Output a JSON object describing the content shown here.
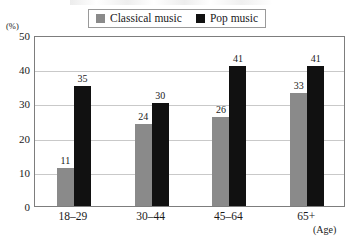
{
  "chart_data": {
    "type": "bar",
    "title": "",
    "xlabel": "(Age)",
    "ylabel": "(%)",
    "categories": [
      "18–29",
      "30–44",
      "45–64",
      "65+"
    ],
    "series": [
      {
        "name": "Classical music",
        "color": "#8a8a8a",
        "values": [
          11,
          24,
          26,
          33
        ]
      },
      {
        "name": "Pop music",
        "color": "#111111",
        "values": [
          35,
          30,
          41,
          41
        ]
      }
    ],
    "ylim": [
      0,
      50
    ],
    "ytick_labels": [
      "50",
      "40",
      "30",
      "20",
      "10",
      "0"
    ],
    "ytick_values": [
      50,
      40,
      30,
      20,
      10,
      0
    ],
    "grid": true,
    "legend_position": "top"
  },
  "legend": {
    "entries": [
      {
        "label": "Classical music",
        "swatch": "#8a8a8a"
      },
      {
        "label": "Pop music",
        "swatch": "#111111"
      }
    ]
  },
  "axis": {
    "y_unit": "(%)",
    "x_unit": "(Age)"
  }
}
